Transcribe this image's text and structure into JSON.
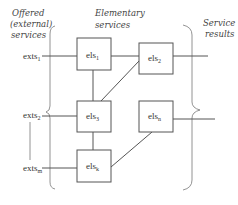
{
  "headers": {
    "offered": [
      "Offered",
      "(external)",
      "services"
    ],
    "elementary": [
      "Elementary",
      "services"
    ],
    "results": [
      "Service",
      "results"
    ]
  },
  "external_services": [
    {
      "base": "exts",
      "sub": "1"
    },
    {
      "base": "exts",
      "sub": "2"
    },
    {
      "base": "exts",
      "sub": "m"
    }
  ],
  "elementary_services": [
    {
      "id": "els1",
      "base": "els",
      "sub": "1"
    },
    {
      "id": "els2",
      "base": "els",
      "sub": "2"
    },
    {
      "id": "els3",
      "base": "els",
      "sub": "3"
    },
    {
      "id": "elsn",
      "base": "els",
      "sub": "n"
    },
    {
      "id": "elsk",
      "base": "els",
      "sub": "k"
    }
  ],
  "connections": [
    [
      "exts1",
      "els1"
    ],
    [
      "exts2",
      "els3"
    ],
    [
      "extsm",
      "elsk"
    ],
    [
      "els1",
      "els2"
    ],
    [
      "els1",
      "els3"
    ],
    [
      "els3",
      "els2"
    ],
    [
      "els3",
      "elsk"
    ],
    [
      "elsk",
      "elsn"
    ],
    [
      "els2",
      "results"
    ],
    [
      "elsn",
      "results"
    ]
  ]
}
